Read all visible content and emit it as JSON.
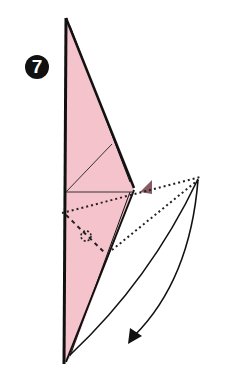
{
  "step": {
    "number": "7"
  },
  "colors": {
    "paper_pink": "#f4c3cb",
    "line": "#1a1a1a",
    "arrow_mark": "#8a5a62"
  },
  "diagram": {
    "symbols": [
      "step-number",
      "valley-fold-lines",
      "pivot-circle",
      "fold-arrow",
      "push-arrow"
    ]
  }
}
